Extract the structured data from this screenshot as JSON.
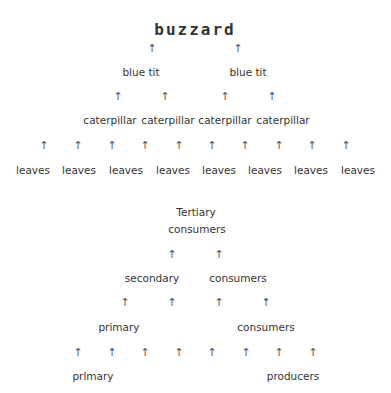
{
  "food_chain": {
    "top": "buzzard",
    "level2": [
      "blue tit",
      "blue tit"
    ],
    "level3": [
      "caterpillar",
      "caterpillar",
      "caterpillar",
      "caterpillar"
    ],
    "level4": [
      "leaves",
      "leaves",
      "leaves",
      "leaves",
      "leaves",
      "leaves",
      "leaves",
      "leaves"
    ]
  },
  "pyramid_labels": {
    "tertiary_1": "Tertiary",
    "tertiary_2": "consumers",
    "secondary_1": "secondary",
    "secondary_2": "consumers",
    "primary_1": "primary",
    "primary_2": "consumers",
    "producers_1": "prlmary",
    "producers_2": "producers"
  },
  "arrow_glyph": "↑"
}
